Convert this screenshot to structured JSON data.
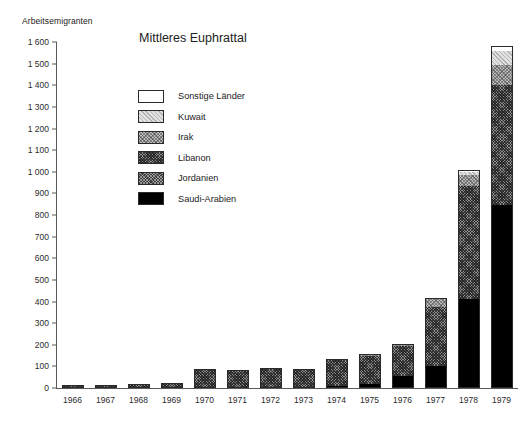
{
  "chart_data": {
    "type": "bar",
    "subtype": "stacked",
    "title": "Mittleres Euphrattal",
    "ylabel": "Arbeitsemigranten",
    "xlabel": "",
    "ylim": [
      0,
      1600
    ],
    "ytick_step": 100,
    "grid": false,
    "legend_position": "inside-upper-left",
    "categories": [
      "1966",
      "1967",
      "1968",
      "1969",
      "1970",
      "1971",
      "1972",
      "1973",
      "1974",
      "1975",
      "1976",
      "1977",
      "1978",
      "1979"
    ],
    "yticks": [
      "0",
      "100",
      "200",
      "300",
      "400",
      "500",
      "600",
      "700",
      "800",
      "900",
      "1 000",
      "1 100",
      "1 200",
      "1 300",
      "1 400",
      "1 500",
      "1 600"
    ],
    "series": [
      {
        "name": "Saudi-Arabien",
        "color": "#000000",
        "pattern": "solid-black",
        "values": [
          0,
          0,
          0,
          0,
          0,
          0,
          0,
          0,
          10,
          20,
          55,
          100,
          410,
          845
        ]
      },
      {
        "name": "Jordanien",
        "color": "#3c3c3c",
        "pattern": "fine-dotted-dark",
        "values": [
          0,
          0,
          0,
          0,
          0,
          0,
          0,
          0,
          0,
          0,
          0,
          0,
          0,
          0
        ]
      },
      {
        "name": "Libanon",
        "color": "#8e8e8e",
        "pattern": "crosshatch-dark",
        "values": [
          15,
          15,
          18,
          22,
          90,
          83,
          93,
          90,
          120,
          130,
          140,
          275,
          525,
          555
        ]
      },
      {
        "name": "Irak",
        "color": "#bdbdbd",
        "pattern": "crosshatch-light",
        "values": [
          0,
          0,
          0,
          0,
          0,
          0,
          0,
          0,
          5,
          5,
          10,
          35,
          50,
          95
        ]
      },
      {
        "name": "Kuwait",
        "color": "#e2e2e2",
        "pattern": "light-stipple",
        "values": [
          0,
          0,
          0,
          0,
          0,
          0,
          0,
          0,
          0,
          0,
          0,
          0,
          15,
          65
        ]
      },
      {
        "name": "Sonstige Länder",
        "color": "#ffffff",
        "pattern": "empty",
        "values": [
          0,
          0,
          0,
          0,
          0,
          0,
          0,
          0,
          0,
          0,
          0,
          5,
          10,
          20
        ]
      }
    ],
    "totals": [
      15,
      15,
      18,
      22,
      90,
      83,
      93,
      90,
      135,
      155,
      205,
      415,
      1010,
      1580
    ]
  },
  "legend": {
    "items": [
      {
        "label": "Sonstige Länder",
        "fill": "f-sonstige"
      },
      {
        "label": "Kuwait",
        "fill": "f-kuwait"
      },
      {
        "label": "Irak",
        "fill": "f-irak"
      },
      {
        "label": "Libanon",
        "fill": "f-libanon"
      },
      {
        "label": "Jordanien",
        "fill": "f-jordanien"
      },
      {
        "label": "Saudi-Arabien",
        "fill": "f-saudi"
      }
    ]
  }
}
